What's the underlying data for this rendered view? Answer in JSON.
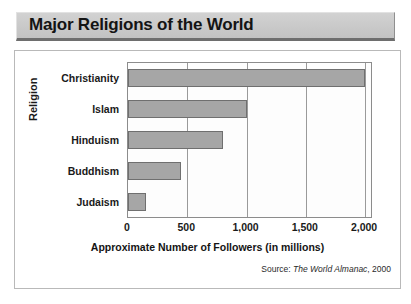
{
  "title": "Major Religions of the World",
  "source": {
    "prefix": "Source:",
    "publication": "The World Almanac",
    "year": ", 2000"
  },
  "colors": {
    "bar_fill": "#a6a6a6",
    "bar_border": "#6f6f6f",
    "banner_fill": "#c9c9c9",
    "banner_shadow": "#6e6e6e",
    "gridline": "#9a9a9a",
    "frame_border": "#b9b9b9"
  },
  "chart_data": {
    "type": "bar",
    "orientation": "horizontal",
    "title": "Major Religions of the World",
    "xlabel": "Approximate Number of Followers (in millions)",
    "ylabel": "Religion",
    "categories": [
      "Christianity",
      "Islam",
      "Hinduism",
      "Buddhism",
      "Judaism"
    ],
    "values": [
      2000,
      1000,
      800,
      450,
      150
    ],
    "xlim": [
      0,
      2050
    ],
    "xticks": [
      0,
      500,
      1000,
      1500,
      2000
    ],
    "xticklabels": [
      "0",
      "500",
      "1,000",
      "1,500",
      "2,000"
    ],
    "grid": "vertical",
    "legend": "none",
    "annotation": "Source: The World Almanac, 2000"
  }
}
